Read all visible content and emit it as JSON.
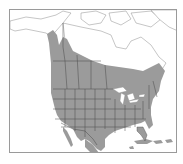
{
  "map": {
    "type": "species-range-map",
    "region": "North America",
    "legend": [],
    "colors": {
      "background": "#ffffff",
      "land": "#ffffff",
      "range": "#9b9b9b",
      "borders": "#4a4a4a",
      "coast": "#8c8c8c",
      "water_lakes": "#ffffff",
      "frame": "#9a9a9a"
    }
  }
}
